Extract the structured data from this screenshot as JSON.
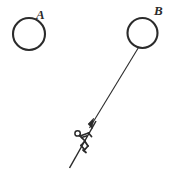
{
  "figure": {
    "title": "",
    "background_color": "#ffffff",
    "ink_color": "#2b2b2b",
    "labels": {
      "circle_a": "A",
      "circle_b": "B"
    },
    "elements": {
      "circle_a_name": "circle-a",
      "circle_b_name": "circle-b",
      "rope_name": "rope-line",
      "arrowhead_name": "rope-arrowhead",
      "skier_name": "stick-figure-skier",
      "ski_name": "ski-line"
    },
    "geometry": {
      "circle_a": {
        "cx": 29,
        "cy": 34,
        "rx": 16,
        "ry": 16
      },
      "circle_b": {
        "cx": 142.5,
        "cy": 33,
        "rx": 15,
        "ry": 15
      },
      "rope": {
        "x1": 138,
        "y1": 47,
        "x2": 89,
        "y2": 129
      },
      "arrow_tip": {
        "x": 89,
        "y": 129
      },
      "ski": {
        "x1": 95,
        "y1": 122,
        "x2": 70,
        "y2": 168
      },
      "skier_head": {
        "cx": 77.5,
        "cy": 133.5,
        "r": 2.8
      }
    }
  }
}
